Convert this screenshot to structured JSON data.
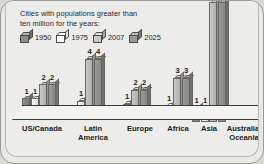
{
  "legend": {
    "line1": "Cities with populations greater than",
    "line2": "ten million for the years:",
    "keys": [
      {
        "year": "1950",
        "color": "#8e8e88"
      },
      {
        "year": "1975",
        "color": "#fbfbf9"
      },
      {
        "year": "2007",
        "color": "#c9c9c3"
      },
      {
        "year": "2025",
        "color": "#9b9b94"
      }
    ]
  },
  "chart_data": {
    "type": "bar",
    "title": "Cities with populations greater than ten million for the years:",
    "xlabel": "",
    "ylabel": "",
    "ylim": [
      0,
      12
    ],
    "grid": false,
    "legend_position": "top-left",
    "categories": [
      "US/Canada",
      "Latin America",
      "Europe",
      "Africa",
      "Asia",
      "Australia/Oceania"
    ],
    "series": [
      {
        "name": "1950",
        "color": "#8e8e88",
        "values": [
          1,
          0,
          0,
          0,
          1,
          0
        ]
      },
      {
        "name": "1975",
        "color": "#fbfbf9",
        "values": [
          1,
          1,
          1,
          1,
          1,
          0
        ]
      },
      {
        "name": "2007",
        "color": "#c9c9c3",
        "values": [
          2,
          4,
          2,
          3,
          12,
          0
        ]
      },
      {
        "name": "2025",
        "color": "#9b9b94",
        "values": [
          2,
          4,
          2,
          3,
          12,
          0
        ]
      }
    ],
    "value_labels": {
      "US/Canada": [
        "1",
        "1",
        "2",
        "2"
      ],
      "Latin America": [
        "0",
        "1",
        "4",
        "4"
      ],
      "Europe": [
        "0",
        "1",
        "2",
        "2"
      ],
      "Africa": [
        "0",
        "1",
        "3",
        "3"
      ],
      "Asia": [
        "1",
        "1",
        "",
        ""
      ],
      "Australia/Oceania": [
        "0",
        "0",
        "0",
        "0"
      ]
    },
    "note": "Asia 2007 and 2025 bars extend beyond the top of the visible chart area"
  },
  "categories": [
    {
      "label_line1": "US/Canada",
      "label_line2": ""
    },
    {
      "label_line1": "Latin",
      "label_line2": "America"
    },
    {
      "label_line1": "Europe",
      "label_line2": ""
    },
    {
      "label_line1": "Africa",
      "label_line2": ""
    },
    {
      "label_line1": "Asia",
      "label_line2": ""
    },
    {
      "label_line1": "Australia/",
      "label_line2": "Oceania"
    }
  ]
}
